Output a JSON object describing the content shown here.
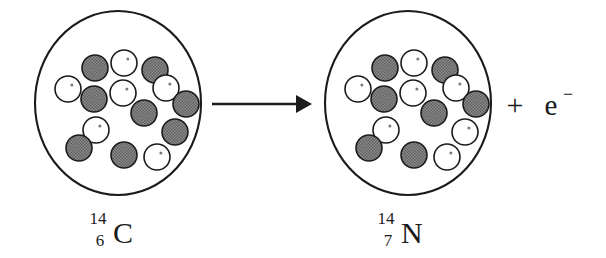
{
  "diagram": {
    "type": "nuclear-reaction",
    "background_color": "#ffffff",
    "stroke_color": "#1b1b1b",
    "neutron_fill": "#7a7a7a",
    "proton_fill": "#ffffff"
  },
  "reactant": {
    "label_mass_number": "14",
    "label_atomic_number": "6",
    "label_element": "C",
    "nucleus_name": "carbon-14-nucleus",
    "nucleus": {
      "cx": 118,
      "cy": 103,
      "rx": 83,
      "ry": 92
    },
    "particle_radius": 13,
    "counts": {
      "neutrons": 8,
      "protons": 6,
      "total_nucleons": 14
    },
    "particles": [
      {
        "type": "neutron",
        "cx": 95,
        "cy": 68
      },
      {
        "type": "proton",
        "cx": 124,
        "cy": 63
      },
      {
        "type": "neutron",
        "cx": 155,
        "cy": 70
      },
      {
        "type": "proton",
        "cx": 68,
        "cy": 89
      },
      {
        "type": "proton",
        "cx": 123,
        "cy": 93
      },
      {
        "type": "proton",
        "cx": 166,
        "cy": 88
      },
      {
        "type": "neutron",
        "cx": 94,
        "cy": 99
      },
      {
        "type": "neutron",
        "cx": 186,
        "cy": 104
      },
      {
        "type": "neutron",
        "cx": 144,
        "cy": 113
      },
      {
        "type": "proton",
        "cx": 96,
        "cy": 130
      },
      {
        "type": "neutron",
        "cx": 175,
        "cy": 132
      },
      {
        "type": "neutron",
        "cx": 79,
        "cy": 148
      },
      {
        "type": "neutron",
        "cx": 124,
        "cy": 155
      },
      {
        "type": "proton",
        "cx": 157,
        "cy": 157
      }
    ]
  },
  "product": {
    "label_mass_number": "14",
    "label_atomic_number": "7",
    "label_element": "N",
    "nucleus_name": "nitrogen-14-nucleus",
    "nucleus": {
      "cx": 408,
      "cy": 103,
      "rx": 83,
      "ry": 92
    },
    "particle_radius": 13,
    "counts": {
      "neutrons": 7,
      "protons": 7,
      "total_nucleons": 14
    },
    "particles": [
      {
        "type": "neutron",
        "cx": 385,
        "cy": 68
      },
      {
        "type": "proton",
        "cx": 414,
        "cy": 63
      },
      {
        "type": "neutron",
        "cx": 445,
        "cy": 70
      },
      {
        "type": "proton",
        "cx": 358,
        "cy": 89
      },
      {
        "type": "proton",
        "cx": 413,
        "cy": 93
      },
      {
        "type": "proton",
        "cx": 456,
        "cy": 88
      },
      {
        "type": "neutron",
        "cx": 384,
        "cy": 99
      },
      {
        "type": "neutron",
        "cx": 476,
        "cy": 104
      },
      {
        "type": "neutron",
        "cx": 434,
        "cy": 113
      },
      {
        "type": "proton",
        "cx": 386,
        "cy": 130
      },
      {
        "type": "proton",
        "cx": 465,
        "cy": 132
      },
      {
        "type": "neutron",
        "cx": 369,
        "cy": 148
      },
      {
        "type": "neutron",
        "cx": 414,
        "cy": 155
      },
      {
        "type": "proton",
        "cx": 447,
        "cy": 157
      }
    ]
  },
  "arrow": {
    "name": "reaction-arrow",
    "x1": 212,
    "x2": 312,
    "y": 104
  },
  "emission": {
    "plus": "+",
    "particle": "e",
    "charge": "−"
  }
}
